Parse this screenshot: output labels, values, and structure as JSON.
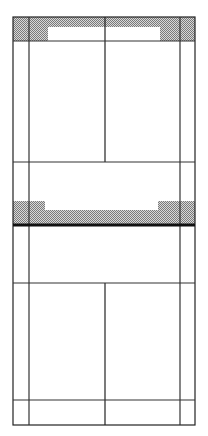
{
  "diagram": {
    "type": "elevation-line-drawing",
    "colors": {
      "background": "#ffffff",
      "line": "#222222",
      "hatch_dark": "#7a7a7a",
      "hatch_light": "#d8d8d8"
    },
    "frame": {
      "x": 13,
      "y": 17,
      "width": 182,
      "height": 408
    },
    "inner_verticals": [
      29,
      180
    ],
    "center_vertical_upper": {
      "x": 105,
      "y1": 17,
      "y2": 162
    },
    "center_vertical_lower": {
      "x": 105,
      "y1": 283,
      "y2": 425
    },
    "horizontal_lines": [
      41,
      162,
      283,
      400
    ],
    "top_band": {
      "y": 17,
      "height": 24,
      "inset": {
        "x": 48,
        "y": 27,
        "width": 112,
        "height": 14
      }
    },
    "mid_band": {
      "y": 201,
      "height": 24,
      "recess": {
        "x": 45,
        "y": 210,
        "width": 113
      }
    },
    "thick_line_y": 225
  }
}
